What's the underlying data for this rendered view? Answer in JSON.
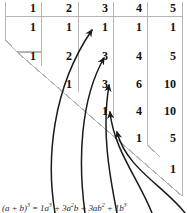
{
  "diagram": {
    "grid_line_color": "#b5b5b5",
    "arrow_color": "#1a1a1a",
    "text_color": "#111111",
    "background": "#ffffff"
  },
  "table": {
    "column_headers": [
      "1",
      "2",
      "3",
      "4",
      "5"
    ],
    "rows": [
      {
        "cells": [
          "1",
          "1",
          "1",
          "1",
          "1"
        ]
      },
      {
        "cells": [
          "1",
          "2",
          "3",
          "4",
          "5"
        ]
      },
      {
        "cells": [
          "",
          "1",
          "3",
          "6",
          "10"
        ]
      },
      {
        "cells": [
          "",
          "",
          "1",
          "4",
          "10"
        ]
      },
      {
        "cells": [
          "",
          "",
          "",
          "1",
          "5"
        ]
      },
      {
        "cells": [
          "",
          "",
          "",
          "",
          "1"
        ]
      }
    ]
  },
  "arrows": {
    "count": 5,
    "targets": [
      "3",
      "1",
      "3",
      "3",
      "1"
    ],
    "description": "curved arrows sweeping up to the anti-diagonal entries"
  },
  "formula": {
    "lhs": "(a + b)",
    "lhs_exp": "3",
    "equals": "=",
    "terms": [
      {
        "coefficient": "1",
        "base": "a",
        "exp": "3"
      },
      {
        "coefficient": "3",
        "base": "a",
        "exp": "2",
        "base2": "b",
        "exp2": ""
      },
      {
        "coefficient": "3",
        "base": "a",
        "exp": "",
        "base2": "b",
        "exp2": "2"
      },
      {
        "coefficient": "1",
        "base": "b",
        "exp": "3"
      }
    ],
    "plain": "(a + b)3 = 1a3 + 3a2b + 3ab2 + 1b3"
  },
  "formula_html": "(a + b)<sup>3</sup> = 1a<sup>3</sup> + 3a<sup>2</sup>b + 3ab<sup>2</sup> + 1b<sup>3</sup>"
}
